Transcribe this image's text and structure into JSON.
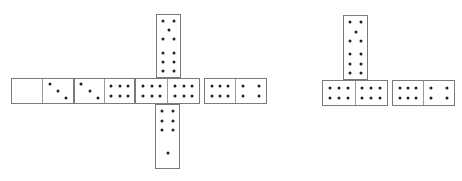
{
  "board": {
    "background": "#ffffff",
    "pip_color": "#222222",
    "border_color": "#7a7a7a",
    "groups": [
      {
        "name": "left-layout",
        "dominoes": [
          {
            "id": "d1",
            "orientation": "h",
            "values": [
              0,
              3
            ],
            "x": 11,
            "y": 78,
            "w": 63,
            "h": 26
          },
          {
            "id": "d2",
            "orientation": "h",
            "values": [
              3,
              6
            ],
            "x": 74,
            "y": 78,
            "w": 61,
            "h": 26
          },
          {
            "id": "d3",
            "orientation": "h",
            "values": [
              6,
              6
            ],
            "x": 135,
            "y": 78,
            "w": 65,
            "h": 26,
            "note": "double six, crossed by spinner column"
          },
          {
            "id": "d4",
            "orientation": "h",
            "values": [
              6,
              4
            ],
            "x": 204,
            "y": 78,
            "w": 63,
            "h": 26
          },
          {
            "id": "d5",
            "orientation": "v",
            "values": [
              5,
              6
            ],
            "x": 156,
            "y": 14,
            "w": 25,
            "h": 64
          },
          {
            "id": "d6",
            "orientation": "v",
            "values": [
              6,
              1
            ],
            "x": 155,
            "y": 104,
            "w": 25,
            "h": 65
          }
        ]
      },
      {
        "name": "right-layout",
        "dominoes": [
          {
            "id": "d7",
            "orientation": "v",
            "values": [
              5,
              6
            ],
            "x": 343,
            "y": 15,
            "w": 25,
            "h": 65
          },
          {
            "id": "d8",
            "orientation": "h",
            "values": [
              6,
              6
            ],
            "x": 322,
            "y": 80,
            "w": 66,
            "h": 26
          },
          {
            "id": "d9",
            "orientation": "h",
            "values": [
              6,
              4
            ],
            "x": 392,
            "y": 80,
            "w": 63,
            "h": 26
          }
        ]
      }
    ]
  }
}
